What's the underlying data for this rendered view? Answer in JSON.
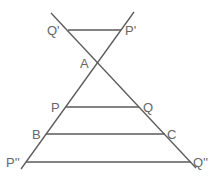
{
  "diagram": {
    "type": "geometry",
    "line_color": "#5a5a5a",
    "label_color": "#666666",
    "points": {
      "Q_prime": {
        "label": "Q'",
        "x": 68,
        "y": 30
      },
      "P_prime": {
        "label": "P'",
        "x": 121,
        "y": 30
      },
      "A": {
        "label": "A",
        "x": 97,
        "y": 62
      },
      "P": {
        "label": "P",
        "x": 66,
        "y": 107
      },
      "Q": {
        "label": "Q",
        "x": 139,
        "y": 107
      },
      "B": {
        "label": "B",
        "x": 46,
        "y": 134
      },
      "C": {
        "label": "C",
        "x": 165,
        "y": 134
      },
      "P_double": {
        "label": "P''",
        "x": 26,
        "y": 162
      },
      "Q_double": {
        "label": "Q''",
        "x": 191,
        "y": 162
      }
    },
    "segments": [
      {
        "name": "transversal-1",
        "from": "Q'",
        "to": "Q''"
      },
      {
        "name": "transversal-2",
        "from": "P'",
        "to": "P''"
      },
      {
        "name": "Q'P'",
        "from": "Q'",
        "to": "P'"
      },
      {
        "name": "PQ",
        "from": "P",
        "to": "Q"
      },
      {
        "name": "BC",
        "from": "B",
        "to": "C"
      },
      {
        "name": "P''Q''",
        "from": "P''",
        "to": "Q''"
      }
    ]
  }
}
